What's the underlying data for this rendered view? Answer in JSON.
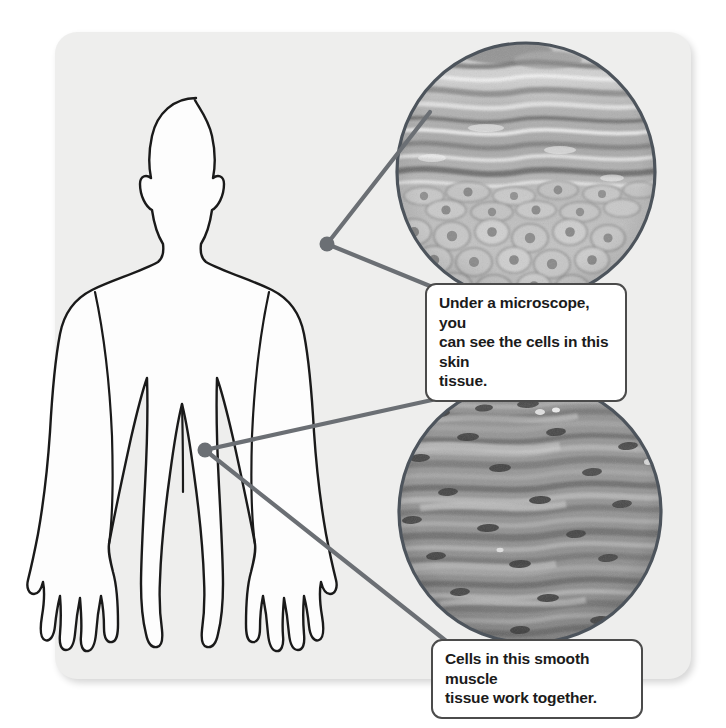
{
  "figure": {
    "panel_background": "#eeeeed",
    "page_background": "#ffffff"
  },
  "diagram": {
    "silhouette_fill": "#fdfdfd",
    "silhouette_stroke": "#1a1a1a",
    "leader_color": "#6b6f74",
    "circle_border_color": "#4d545c"
  },
  "callouts": [
    {
      "id": "skin",
      "name": "skin-tissue-callout",
      "text": "Under a microscope, you\ncan see the cells in this skin\ntissue.",
      "border_color": "#4b4b4b",
      "fill": "#ffffff"
    },
    {
      "id": "muscle",
      "name": "smooth-muscle-callout",
      "text": "Cells in this smooth muscle\ntissue work together.",
      "border_color": "#4b4b4b",
      "fill": "#ffffff"
    }
  ],
  "micrographs": [
    {
      "id": "skin",
      "name": "skin-tissue-micrograph",
      "tissue": "skin tissue",
      "description": "Grayscale light micrograph of stratified squamous epithelium with wavy keratin layers above polygonal cells",
      "center_x": 526,
      "center_y": 172,
      "radius": 130,
      "linked_from": "shoulder"
    },
    {
      "id": "muscle",
      "name": "smooth-muscle-micrograph",
      "tissue": "smooth muscle tissue",
      "description": "Grayscale light micrograph of elongated spindle-shaped smooth muscle fibers with dark nuclei",
      "center_x": 530,
      "center_y": 512,
      "radius": 132,
      "linked_from": "abdomen"
    }
  ],
  "leader_points": [
    {
      "name": "shoulder-leader-dot",
      "x": 327,
      "y": 244
    },
    {
      "name": "abdomen-leader-dot",
      "x": 205,
      "y": 450
    }
  ]
}
